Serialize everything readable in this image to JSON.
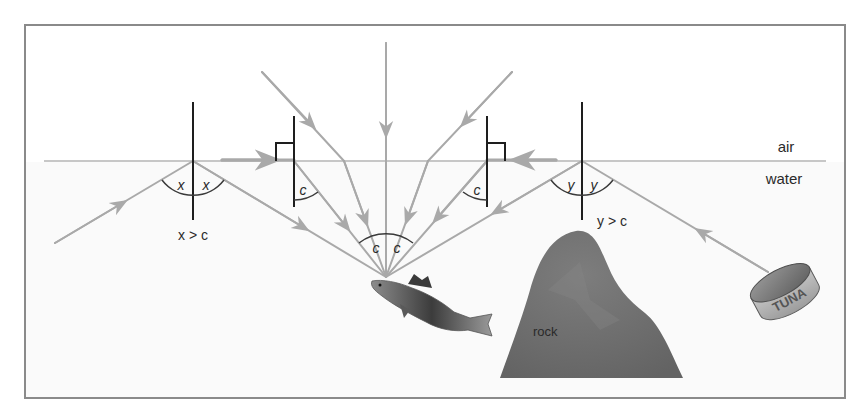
{
  "diagram": {
    "media": {
      "upper": "air",
      "lower": "water"
    },
    "angle_labels": {
      "left_incident": "x",
      "left_reflected": "x",
      "left_condition": "x > c",
      "critical_left": "c",
      "critical_right": "c",
      "cone_left": "c",
      "cone_right": "c",
      "right_incident": "y",
      "right_reflected": "y",
      "right_condition": "y > c"
    },
    "objects": {
      "rock": "rock",
      "can": "TUNA"
    },
    "colors": {
      "ray": "#a9a9a9",
      "normal": "#1e1e1e",
      "surface": "#b5b5b5",
      "frame": "#8a8a8a",
      "rock": "#6e6e6e",
      "water_tint": "#fafafa"
    }
  }
}
